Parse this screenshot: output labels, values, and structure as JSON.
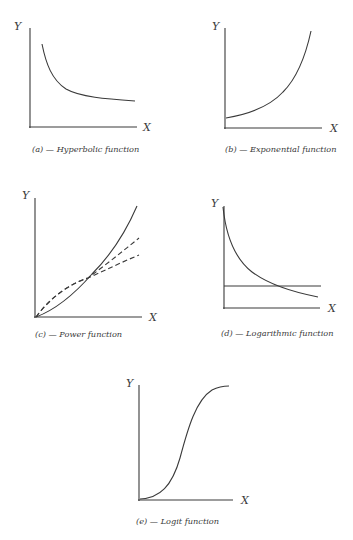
{
  "figure": {
    "panels": [
      {
        "id": "a",
        "caption": "(a) — Hyperbolic function",
        "x_label": "X",
        "y_label": "Y",
        "curves": [
          {
            "style": "solid",
            "shape": "hyperbolic decay"
          }
        ]
      },
      {
        "id": "b",
        "caption": "(b) — Exponential function",
        "x_label": "X",
        "y_label": "Y",
        "curves": [
          {
            "style": "solid",
            "shape": "exponential growth"
          }
        ]
      },
      {
        "id": "c",
        "caption": "(c) — Power function",
        "x_label": "X",
        "y_label": "Y",
        "curves": [
          {
            "style": "solid",
            "shape": "power > 1 (convex)"
          },
          {
            "style": "dashed",
            "shape": "power < 1 (concave)"
          },
          {
            "style": "dashed",
            "shape": "power < 1 (more concave)"
          }
        ]
      },
      {
        "id": "d",
        "caption": "(d) — Logarithmic function",
        "x_label": "X",
        "y_label": "Y",
        "curves": [
          {
            "style": "solid",
            "shape": "logarithmic decay"
          },
          {
            "style": "solid",
            "shape": "horizontal reference line"
          }
        ]
      },
      {
        "id": "e",
        "caption": "(e) — Logit function",
        "x_label": "X",
        "y_label": "Y",
        "curves": [
          {
            "style": "solid",
            "shape": "sigmoid (S-curve)"
          }
        ]
      }
    ]
  },
  "colors": {
    "ink": "#3a3a3a",
    "background": "#ffffff"
  }
}
